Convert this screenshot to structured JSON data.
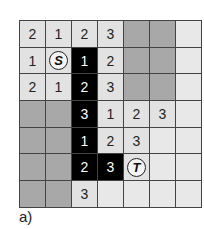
{
  "caption": "a)",
  "grid": {
    "rows": 7,
    "cols": 7,
    "cells": [
      [
        {
          "t": "num",
          "v": "2"
        },
        {
          "t": "num",
          "v": "1"
        },
        {
          "t": "num",
          "v": "2"
        },
        {
          "t": "num",
          "v": "3"
        },
        {
          "t": "obstacle",
          "v": ""
        },
        {
          "t": "obstacle",
          "v": ""
        },
        {
          "t": "empty",
          "v": ""
        }
      ],
      [
        {
          "t": "num",
          "v": "1"
        },
        {
          "t": "start",
          "v": "S"
        },
        {
          "t": "path",
          "v": "1"
        },
        {
          "t": "num",
          "v": "2"
        },
        {
          "t": "obstacle",
          "v": ""
        },
        {
          "t": "obstacle",
          "v": ""
        },
        {
          "t": "empty",
          "v": ""
        }
      ],
      [
        {
          "t": "num",
          "v": "2"
        },
        {
          "t": "num",
          "v": "1"
        },
        {
          "t": "path",
          "v": "2"
        },
        {
          "t": "num",
          "v": "3"
        },
        {
          "t": "obstacle",
          "v": ""
        },
        {
          "t": "obstacle",
          "v": ""
        },
        {
          "t": "empty",
          "v": ""
        }
      ],
      [
        {
          "t": "obstacle",
          "v": ""
        },
        {
          "t": "obstacle",
          "v": ""
        },
        {
          "t": "path",
          "v": "3"
        },
        {
          "t": "num",
          "v": "1"
        },
        {
          "t": "num",
          "v": "2"
        },
        {
          "t": "num",
          "v": "3"
        },
        {
          "t": "empty",
          "v": ""
        }
      ],
      [
        {
          "t": "obstacle",
          "v": ""
        },
        {
          "t": "obstacle",
          "v": ""
        },
        {
          "t": "path",
          "v": "1"
        },
        {
          "t": "num",
          "v": "2"
        },
        {
          "t": "num",
          "v": "3"
        },
        {
          "t": "empty",
          "v": ""
        },
        {
          "t": "empty",
          "v": ""
        }
      ],
      [
        {
          "t": "obstacle",
          "v": ""
        },
        {
          "t": "obstacle",
          "v": ""
        },
        {
          "t": "path",
          "v": "2"
        },
        {
          "t": "path",
          "v": "3"
        },
        {
          "t": "target",
          "v": "T"
        },
        {
          "t": "empty",
          "v": ""
        },
        {
          "t": "empty",
          "v": ""
        }
      ],
      [
        {
          "t": "obstacle",
          "v": ""
        },
        {
          "t": "obstacle",
          "v": ""
        },
        {
          "t": "num",
          "v": "3"
        },
        {
          "t": "empty",
          "v": ""
        },
        {
          "t": "empty",
          "v": ""
        },
        {
          "t": "empty",
          "v": ""
        },
        {
          "t": "empty",
          "v": ""
        }
      ]
    ]
  },
  "colors": {
    "cell": "#e2e2e2",
    "obstacle": "#a8a8a8",
    "path": "#000000",
    "grid_line": "#444444"
  }
}
